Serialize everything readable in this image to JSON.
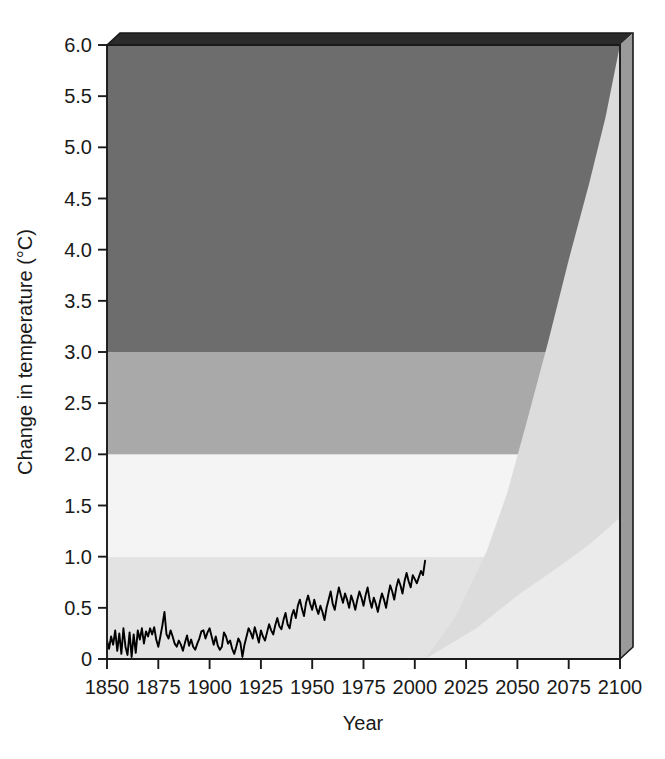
{
  "chart_data": {
    "type": "area",
    "title": "",
    "subtitle": "",
    "xlabel": "Year",
    "ylabel": "Change in temperature (°C)",
    "xlim": [
      1850,
      2100
    ],
    "ylim": [
      0,
      6.0
    ],
    "grid": false,
    "legend_position": "none",
    "x_ticks": [
      1850,
      1875,
      1900,
      1925,
      1950,
      1975,
      2000,
      2025,
      2050,
      2075,
      2100
    ],
    "x_tick_labels": [
      "1850",
      "1875",
      "1900",
      "1925",
      "1950",
      "1975",
      "2000",
      "2025",
      "2050",
      "2075",
      "2100"
    ],
    "y_ticks": [
      0,
      0.5,
      1.0,
      1.5,
      2.0,
      2.5,
      3.0,
      3.5,
      4.0,
      4.5,
      5.0,
      5.5,
      6.0
    ],
    "y_tick_labels": [
      "0",
      "0.5",
      "1.0",
      "1.5",
      "2.0",
      "2.5",
      "3.0",
      "3.5",
      "4.0",
      "4.5",
      "5.0",
      "5.5",
      "6.0"
    ],
    "bands": [
      {
        "name": "band-0-1",
        "from": 0.0,
        "to": 1.0,
        "color": "#e3e3e3"
      },
      {
        "name": "band-1-2",
        "from": 1.0,
        "to": 2.0,
        "color": "#f4f4f4"
      },
      {
        "name": "band-2-3",
        "from": 2.0,
        "to": 3.0,
        "color": "#a9a9a9"
      },
      {
        "name": "band-3-6",
        "from": 3.0,
        "to": 6.0,
        "color": "#6d6d6d"
      }
    ],
    "projection_upper_wedge": {
      "name": "projection-upper-bound",
      "color": "#dcdcdc",
      "points": [
        [
          2005,
          0.0
        ],
        [
          2020,
          0.42
        ],
        [
          2035,
          1.05
        ],
        [
          2045,
          1.62
        ],
        [
          2055,
          2.35
        ],
        [
          2065,
          3.1
        ],
        [
          2075,
          3.9
        ],
        [
          2085,
          4.65
        ],
        [
          2093,
          5.3
        ],
        [
          2100,
          6.0
        ]
      ]
    },
    "projection_lower_wedge": {
      "name": "projection-lower-bound",
      "color": "#ebebeb",
      "points": [
        [
          2005,
          0.0
        ],
        [
          2030,
          0.3
        ],
        [
          2050,
          0.62
        ],
        [
          2070,
          0.9
        ],
        [
          2085,
          1.12
        ],
        [
          2100,
          1.38
        ]
      ]
    },
    "observed_series": {
      "name": "Observed global mean temperature change",
      "color": "#000000",
      "start_year": 1850,
      "end_year": 2005,
      "values": [
        0.18,
        0.1,
        0.22,
        0.14,
        0.28,
        0.08,
        0.25,
        0.05,
        0.3,
        0.12,
        0.04,
        0.26,
        0.02,
        0.24,
        0.06,
        0.28,
        0.19,
        0.3,
        0.15,
        0.27,
        0.22,
        0.3,
        0.24,
        0.31,
        0.19,
        0.12,
        0.22,
        0.33,
        0.46,
        0.24,
        0.2,
        0.28,
        0.22,
        0.15,
        0.12,
        0.18,
        0.14,
        0.08,
        0.16,
        0.23,
        0.13,
        0.19,
        0.12,
        0.09,
        0.15,
        0.2,
        0.27,
        0.28,
        0.2,
        0.26,
        0.3,
        0.22,
        0.14,
        0.22,
        0.13,
        0.09,
        0.12,
        0.26,
        0.22,
        0.15,
        0.18,
        0.1,
        0.05,
        0.12,
        0.2,
        0.16,
        0.02,
        0.14,
        0.22,
        0.3,
        0.26,
        0.2,
        0.31,
        0.24,
        0.16,
        0.28,
        0.22,
        0.18,
        0.26,
        0.34,
        0.28,
        0.24,
        0.33,
        0.4,
        0.32,
        0.29,
        0.38,
        0.45,
        0.34,
        0.3,
        0.42,
        0.48,
        0.4,
        0.52,
        0.58,
        0.49,
        0.42,
        0.55,
        0.62,
        0.54,
        0.48,
        0.58,
        0.5,
        0.44,
        0.52,
        0.46,
        0.38,
        0.5,
        0.58,
        0.66,
        0.54,
        0.48,
        0.6,
        0.7,
        0.62,
        0.55,
        0.64,
        0.58,
        0.5,
        0.62,
        0.56,
        0.48,
        0.58,
        0.66,
        0.6,
        0.52,
        0.62,
        0.7,
        0.58,
        0.5,
        0.6,
        0.54,
        0.46,
        0.56,
        0.64,
        0.58,
        0.5,
        0.62,
        0.72,
        0.66,
        0.58,
        0.7,
        0.78,
        0.72,
        0.64,
        0.76,
        0.84,
        0.76,
        0.7,
        0.82,
        0.78,
        0.74,
        0.8,
        0.86,
        0.82,
        0.96
      ]
    }
  },
  "axes": {
    "x_axis_name": "Year",
    "y_axis_name": "Change in temperature (°C)"
  },
  "colors": {
    "band_dark": "#6d6d6d",
    "band_mid": "#a9a9a9",
    "band_light": "#f4f4f4",
    "band_pale": "#e3e3e3",
    "wedge_upper": "#dcdcdc",
    "wedge_lower": "#ebebeb",
    "line": "#000000",
    "frame": "#1a1a1a",
    "bevel": "#2b2b2b",
    "bevel_side": "#9a9a9a"
  }
}
